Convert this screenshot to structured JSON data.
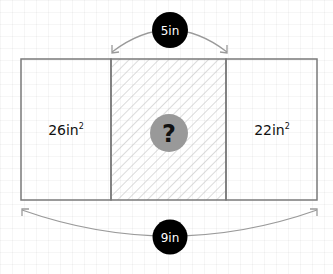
{
  "diagram": {
    "colors": {
      "outline": "#7a7a7a",
      "hatch": "#c8c8c8",
      "badge": "#000000",
      "badge_text": "#ffffff",
      "question_circle": "#999999",
      "question_mark": "#111111",
      "arrow": "#9a9a9a"
    },
    "top_dimension": {
      "label": "5in"
    },
    "bottom_dimension": {
      "label": "9in"
    },
    "left_region": {
      "label": "26in",
      "exponent": "2"
    },
    "middle_region": {
      "label": "?",
      "pattern": "diagonal-hatch"
    },
    "right_region": {
      "label": "22in",
      "exponent": "2"
    }
  }
}
